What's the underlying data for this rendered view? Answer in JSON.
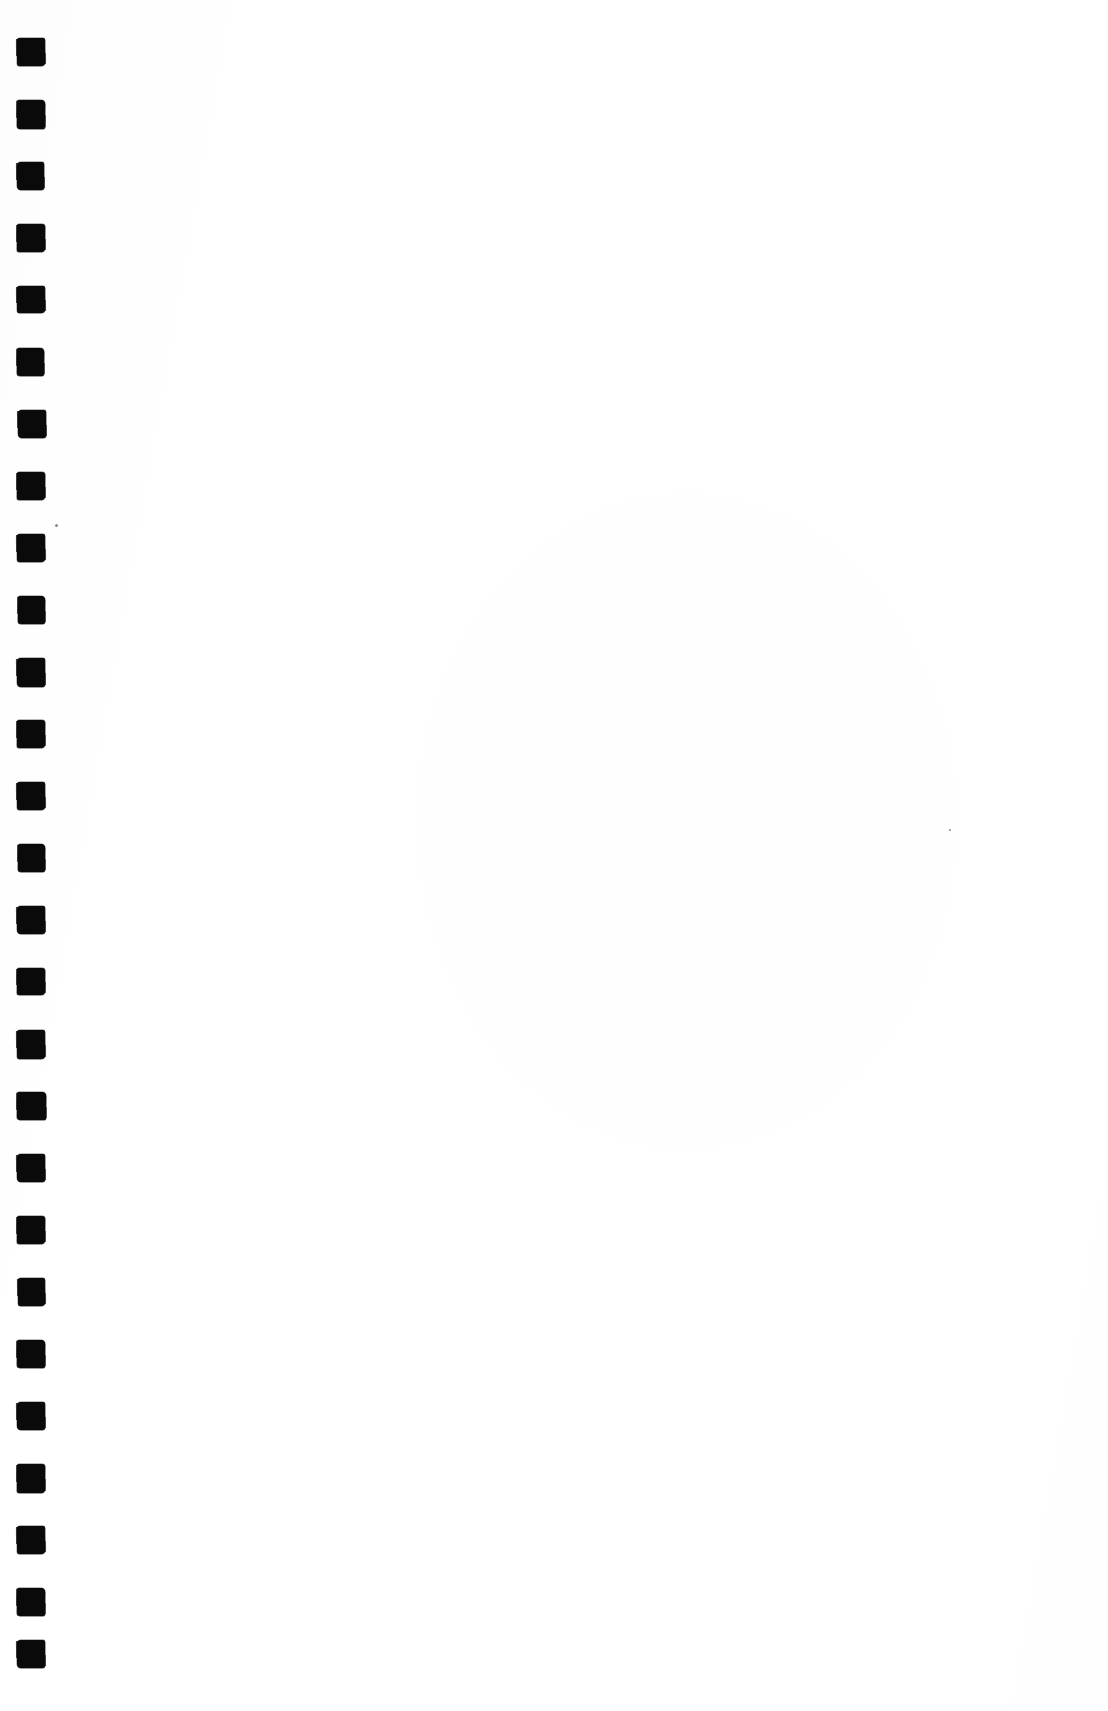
{
  "page": {
    "kind": "scanned-blank-page",
    "width": 1108,
    "height": 1711,
    "background_color": "#ffffff",
    "body_text": "",
    "visible_text": []
  },
  "binding_strip": {
    "name": "binding-punch-marks",
    "mark_color": "#0a0a0a",
    "mark_count": 27,
    "mark_width": 28,
    "mark_height": 28,
    "left_offset": 17,
    "first_mark_top": 38,
    "pitch": 62,
    "marks": [
      {
        "index": 1,
        "top": 38,
        "left": 17,
        "w": 28,
        "h": 28,
        "variant": "v1"
      },
      {
        "index": 2,
        "top": 100,
        "left": 17,
        "w": 28,
        "h": 29,
        "variant": "v2"
      },
      {
        "index": 3,
        "top": 162,
        "left": 17,
        "w": 27,
        "h": 28,
        "variant": "v3"
      },
      {
        "index": 4,
        "top": 224,
        "left": 17,
        "w": 28,
        "h": 28,
        "variant": "v4"
      },
      {
        "index": 5,
        "top": 286,
        "left": 17,
        "w": 28,
        "h": 27,
        "variant": "v1"
      },
      {
        "index": 6,
        "top": 348,
        "left": 17,
        "w": 27,
        "h": 28,
        "variant": "v2"
      },
      {
        "index": 7,
        "top": 410,
        "left": 18,
        "w": 28,
        "h": 28,
        "variant": "v3"
      },
      {
        "index": 8,
        "top": 472,
        "left": 17,
        "w": 28,
        "h": 28,
        "variant": "v4"
      },
      {
        "index": 9,
        "top": 534,
        "left": 17,
        "w": 28,
        "h": 28,
        "variant": "v1"
      },
      {
        "index": 10,
        "top": 596,
        "left": 18,
        "w": 27,
        "h": 28,
        "variant": "v2"
      },
      {
        "index": 11,
        "top": 658,
        "left": 17,
        "w": 28,
        "h": 29,
        "variant": "v3"
      },
      {
        "index": 12,
        "top": 720,
        "left": 17,
        "w": 28,
        "h": 28,
        "variant": "v4"
      },
      {
        "index": 13,
        "top": 782,
        "left": 17,
        "w": 28,
        "h": 28,
        "variant": "v1"
      },
      {
        "index": 14,
        "top": 844,
        "left": 18,
        "w": 27,
        "h": 28,
        "variant": "v2"
      },
      {
        "index": 15,
        "top": 906,
        "left": 17,
        "w": 28,
        "h": 28,
        "variant": "v3"
      },
      {
        "index": 16,
        "top": 968,
        "left": 17,
        "w": 28,
        "h": 27,
        "variant": "v4"
      },
      {
        "index": 17,
        "top": 1030,
        "left": 17,
        "w": 28,
        "h": 29,
        "variant": "v1"
      },
      {
        "index": 18,
        "top": 1092,
        "left": 17,
        "w": 29,
        "h": 28,
        "variant": "v2"
      },
      {
        "index": 19,
        "top": 1154,
        "left": 17,
        "w": 28,
        "h": 28,
        "variant": "v3"
      },
      {
        "index": 20,
        "top": 1216,
        "left": 17,
        "w": 28,
        "h": 28,
        "variant": "v4"
      },
      {
        "index": 21,
        "top": 1278,
        "left": 18,
        "w": 27,
        "h": 28,
        "variant": "v1"
      },
      {
        "index": 22,
        "top": 1340,
        "left": 17,
        "w": 28,
        "h": 28,
        "variant": "v2"
      },
      {
        "index": 23,
        "top": 1402,
        "left": 17,
        "w": 28,
        "h": 28,
        "variant": "v3"
      },
      {
        "index": 24,
        "top": 1464,
        "left": 17,
        "w": 28,
        "h": 29,
        "variant": "v4"
      },
      {
        "index": 25,
        "top": 1526,
        "left": 17,
        "w": 28,
        "h": 28,
        "variant": "v1"
      },
      {
        "index": 26,
        "top": 1588,
        "left": 17,
        "w": 28,
        "h": 28,
        "variant": "v2"
      },
      {
        "index": 27,
        "top": 1640,
        "left": 17,
        "w": 28,
        "h": 28,
        "variant": "v3"
      }
    ]
  },
  "specks": [
    {
      "left": 55,
      "top": 524,
      "size": 3
    },
    {
      "left": 949,
      "top": 829,
      "size": 2
    }
  ]
}
